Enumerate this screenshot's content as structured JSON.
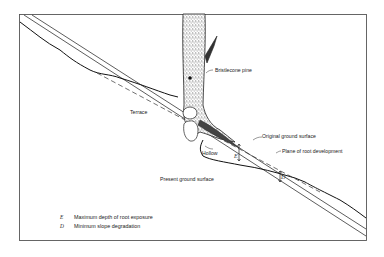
{
  "figure": {
    "labels": {
      "bristlecone_pine": "Bristlecone pine",
      "terrace": "Terrace",
      "hollow": "Hollow",
      "original_ground_surface": "Original ground surface",
      "plane_of_root_development": "Plane of root development",
      "present_ground_surface": "Present ground surface",
      "E_marker": "E",
      "D_marker": "D"
    },
    "legend": [
      {
        "key": "E",
        "text": "Maximum depth of root exposure"
      },
      {
        "key": "D",
        "text": "Minimum slope degradation"
      }
    ],
    "colors": {
      "line": "#222222",
      "frame": "#555555",
      "background": "#ffffff"
    }
  }
}
